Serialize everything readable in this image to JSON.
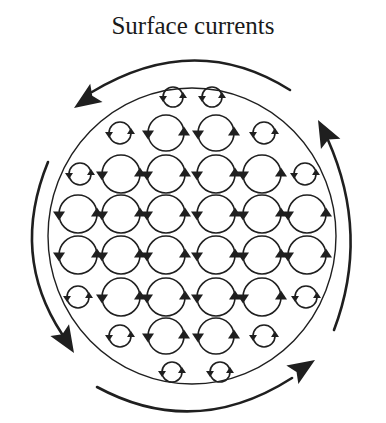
{
  "title": "Surface currents",
  "colors": {
    "stroke": "#1f1f1f",
    "background": "#ffffff"
  },
  "basin": {
    "cx": 192,
    "cy": 236,
    "rx": 144,
    "ry": 148
  },
  "outer_currents": [
    {
      "name": "top",
      "direction": "counterclockwise",
      "path": "M 290 90 Q 195 30 92 92",
      "arrow": {
        "tip": [
          74,
          108
        ],
        "angle": 146
      }
    },
    {
      "name": "left",
      "direction": "counterclockwise",
      "path": "M 48 162 Q 10 255 62 334",
      "arrow": {
        "tip": [
          74,
          353
        ],
        "angle": 58
      }
    },
    {
      "name": "bottom",
      "direction": "counterclockwise",
      "path": "M 97 387 Q 195 440 292 378",
      "arrow": {
        "tip": [
          315,
          360
        ],
        "angle": -33
      }
    },
    {
      "name": "right",
      "direction": "counterclockwise",
      "path": "M 334 330 Q 370 235 328 140",
      "arrow": {
        "tip": [
          318,
          120
        ],
        "angle": -118
      }
    }
  ],
  "gyres": [
    {
      "x": 173,
      "y": 97,
      "r": 10
    },
    {
      "x": 212,
      "y": 97,
      "r": 10
    },
    {
      "x": 120,
      "y": 133,
      "r": 11
    },
    {
      "x": 166,
      "y": 133,
      "r": 18
    },
    {
      "x": 216,
      "y": 133,
      "r": 18
    },
    {
      "x": 264,
      "y": 133,
      "r": 11
    },
    {
      "x": 80,
      "y": 174,
      "r": 11
    },
    {
      "x": 121,
      "y": 174,
      "r": 19
    },
    {
      "x": 166,
      "y": 174,
      "r": 19
    },
    {
      "x": 216,
      "y": 174,
      "r": 19
    },
    {
      "x": 262,
      "y": 174,
      "r": 19
    },
    {
      "x": 305,
      "y": 174,
      "r": 11
    },
    {
      "x": 78,
      "y": 214,
      "r": 19
    },
    {
      "x": 121,
      "y": 214,
      "r": 19
    },
    {
      "x": 166,
      "y": 214,
      "r": 19
    },
    {
      "x": 216,
      "y": 214,
      "r": 19
    },
    {
      "x": 262,
      "y": 214,
      "r": 19
    },
    {
      "x": 307,
      "y": 214,
      "r": 19
    },
    {
      "x": 78,
      "y": 255,
      "r": 19
    },
    {
      "x": 121,
      "y": 255,
      "r": 19
    },
    {
      "x": 166,
      "y": 255,
      "r": 19
    },
    {
      "x": 216,
      "y": 255,
      "r": 19
    },
    {
      "x": 262,
      "y": 255,
      "r": 19
    },
    {
      "x": 307,
      "y": 255,
      "r": 19
    },
    {
      "x": 78,
      "y": 297,
      "r": 11
    },
    {
      "x": 121,
      "y": 297,
      "r": 19
    },
    {
      "x": 166,
      "y": 297,
      "r": 19
    },
    {
      "x": 216,
      "y": 297,
      "r": 19
    },
    {
      "x": 262,
      "y": 297,
      "r": 19
    },
    {
      "x": 306,
      "y": 297,
      "r": 11
    },
    {
      "x": 120,
      "y": 336,
      "r": 11
    },
    {
      "x": 166,
      "y": 336,
      "r": 18
    },
    {
      "x": 216,
      "y": 336,
      "r": 18
    },
    {
      "x": 264,
      "y": 336,
      "r": 11
    },
    {
      "x": 172,
      "y": 372,
      "r": 10
    },
    {
      "x": 220,
      "y": 372,
      "r": 10
    }
  ]
}
